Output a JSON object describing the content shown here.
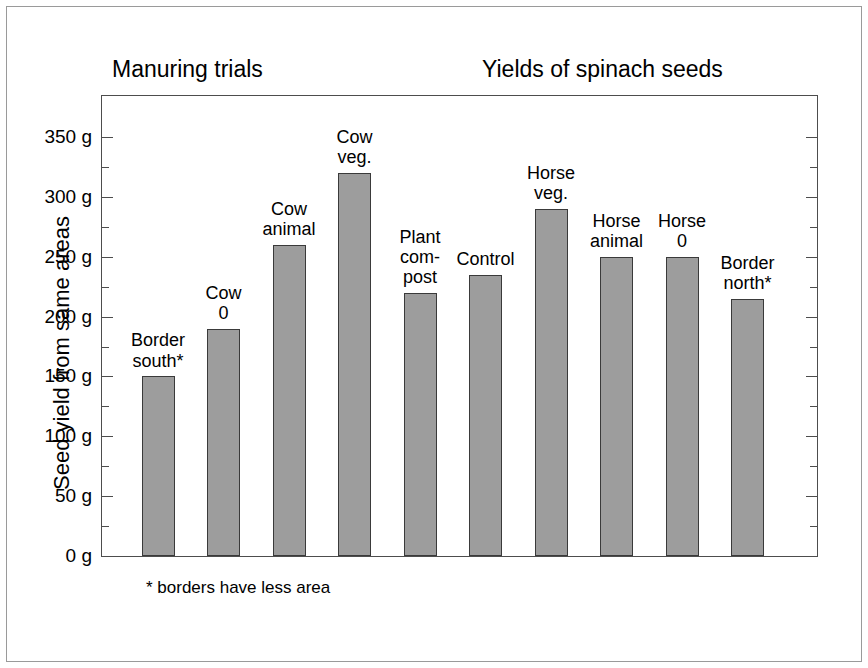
{
  "figure": {
    "title_left": "Manuring trials",
    "title_right": "Yields of spinach seeds",
    "footnote": "* borders have less area",
    "bar_color": "#9d9d9d",
    "bar_edge_color": "#3a3a3a",
    "axis_color": "#4d4d4d",
    "frame_color": "#9a9a9a",
    "background": "#ffffff"
  },
  "chart_data": {
    "type": "bar",
    "subtitle": "",
    "xlabel": "",
    "ylabel": "Seed yield from same areas",
    "ylim": [
      0,
      350
    ],
    "y_unit": "g",
    "y_major_step": 50,
    "y_minor_step": 25,
    "grid": false,
    "legend": "none",
    "annotations": [
      "* borders have less area"
    ],
    "tick_labels": [
      "0 g",
      "50 g",
      "100 g",
      "150 g",
      "200 g",
      "250 g",
      "300 g",
      "350 g"
    ],
    "tick_values": [
      0,
      50,
      100,
      150,
      200,
      250,
      300,
      350
    ],
    "categories": [
      "Border south*",
      "Cow 0",
      "Cow animal",
      "Cow veg.",
      "Plant compost",
      "Control",
      "Horse veg.",
      "Horse animal",
      "Horse 0",
      "Border north*"
    ],
    "category_labels_wrapped": [
      "Border\nsouth*",
      "Cow\n0",
      "Cow\nanimal",
      "Cow\nveg.",
      "Plant\ncom-\npost",
      "Control",
      "Horse\nveg.",
      "Horse\nanimal",
      "Horse\n0",
      "Border\nnorth*"
    ],
    "values": [
      150,
      190,
      260,
      320,
      220,
      235,
      290,
      250,
      250,
      215
    ]
  }
}
